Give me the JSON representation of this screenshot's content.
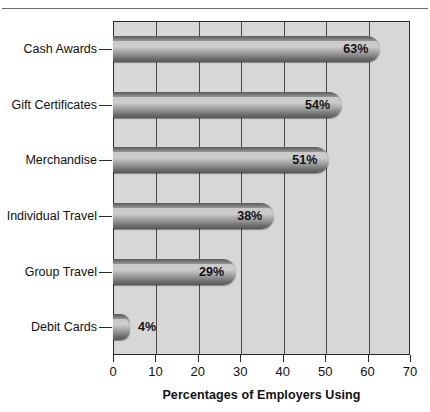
{
  "top_rule": {
    "cutoff_text": "·   ··"
  },
  "chart_data": {
    "type": "bar",
    "orientation": "horizontal",
    "title": "",
    "xlabel": "Percentages of Employers Using",
    "ylabel": "",
    "xlim": [
      0,
      70
    ],
    "xticks": [
      0,
      10,
      20,
      30,
      40,
      50,
      60,
      70
    ],
    "grid": true,
    "legend": false,
    "categories": [
      "Cash Awards",
      "Gift Certificates",
      "Merchandise",
      "Individual Travel",
      "Group Travel",
      "Debit Cards"
    ],
    "values": [
      63,
      54,
      51,
      38,
      29,
      4
    ],
    "value_labels": [
      "63%",
      "54%",
      "51%",
      "38%",
      "29%",
      "4%"
    ],
    "label_placement": [
      "inside",
      "inside",
      "inside",
      "inside",
      "inside",
      "outside"
    ]
  },
  "colors": {
    "plot_background": "#d7d7d5",
    "frame": "#2b2b2b",
    "gridline": "#4a4a4a",
    "bar_dark": "#575757",
    "bar_light": "#c6c6c6",
    "text": "#111111",
    "page_background": "#ffffff"
  }
}
